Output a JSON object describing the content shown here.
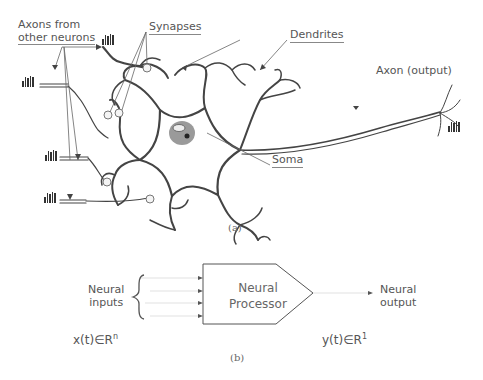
{
  "figure_a": {
    "labels": {
      "axons_from_line1": "Axons from",
      "axons_from_line2": "other neurons",
      "synapses": "Synapses",
      "dendrites": "Dendrites",
      "axon_output": "Axon (output)",
      "soma": "Soma"
    },
    "caption": "(a)"
  },
  "figure_b": {
    "inputs_label_line1": "Neural",
    "inputs_label_line2": "inputs",
    "processor_line1": "Neural",
    "processor_line2": "Processor",
    "output_label_line1": "Neural",
    "output_label_line2": "output",
    "input_space": "x(t)∈R",
    "input_exp": "n",
    "output_space": "y(t)∈R",
    "output_exp": "1",
    "caption": "(b)"
  }
}
